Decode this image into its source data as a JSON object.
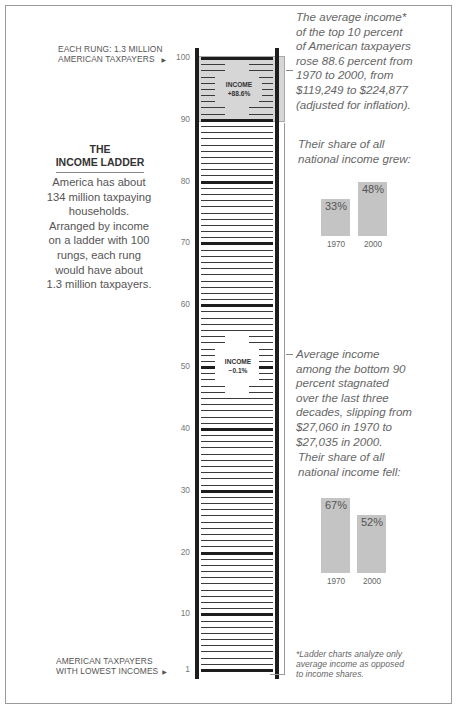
{
  "chart_data": {
    "type": "bar",
    "title": "The Income Ladder",
    "subtitle": "America has about 134 million taxpaying households. Arranged by income on a ladder with 100 rungs, each rung would have about 1.3 million taxpayers.",
    "ladder": {
      "rungs": 100,
      "tick_labels": [
        "100",
        "90",
        "80",
        "70",
        "60",
        "50",
        "40",
        "30",
        "20",
        "10",
        "1"
      ],
      "top_label": "EACH RUNG: 1.3 MILLION AMERICAN TAXPAYERS",
      "bottom_label": "AMERICAN TAXPAYERS WITH LOWEST INCOMES",
      "highlights": [
        {
          "range": [
            90,
            100
          ],
          "label": "INCOME",
          "value": "+88.6%"
        },
        {
          "range": [
            1,
            90
          ],
          "label": "INCOME",
          "value": "−0.1%"
        }
      ]
    },
    "series": [
      {
        "name": "Top 10 percent share of national income",
        "categories": [
          "1970",
          "2000"
        ],
        "values": [
          33,
          48
        ],
        "unit": "%"
      },
      {
        "name": "Bottom 90 percent share of national income",
        "categories": [
          "1970",
          "2000"
        ],
        "values": [
          67,
          52
        ],
        "unit": "%"
      }
    ],
    "ylim": [
      0,
      100
    ],
    "grid": false
  },
  "labels": {
    "top_label_line1": "EACH RUNG: 1.3 MILLION",
    "top_label_line2": "AMERICAN TAXPAYERS",
    "bottom_label_line1": "AMERICAN TAXPAYERS",
    "bottom_label_line2": "WITH LOWEST INCOMES",
    "arrow": "▶",
    "ticks": [
      "100",
      "90",
      "80",
      "70",
      "60",
      "50",
      "40",
      "30",
      "20",
      "10",
      "1"
    ]
  },
  "title": {
    "line1": "THE",
    "line2": "INCOME LADDER"
  },
  "intro": {
    "lines": [
      "America has about",
      "134 million taxpaying",
      "households.",
      "Arranged by income",
      "on a ladder with 100",
      "rungs, each rung",
      "would have about",
      "1.3 million taxpayers."
    ]
  },
  "top": {
    "box_label": "INCOME",
    "box_value": "+88.6%",
    "text_lines": [
      "The average income*",
      "of the top 10 percent",
      "of American taxpayers",
      "rose 88.6 percent from",
      "1970 to 2000, from",
      "$119,249 to $224,877",
      "(adjusted for inflation)."
    ],
    "share_lines": [
      "Their share of all",
      "national income grew:"
    ],
    "bars": [
      {
        "year": "1970",
        "value": "33%"
      },
      {
        "year": "2000",
        "value": "48%"
      }
    ]
  },
  "bottom": {
    "box_label": "INCOME",
    "box_value": "−0.1%",
    "text_lines": [
      "Average income",
      "among the bottom 90",
      "percent stagnated",
      "over the last three",
      "decades, slipping from",
      "$27,060 in 1970 to",
      "$27,035 in 2000."
    ],
    "share_lines": [
      "Their share of all",
      "national income fell:"
    ],
    "bars": [
      {
        "year": "1970",
        "value": "67%"
      },
      {
        "year": "2000",
        "value": "52%"
      }
    ]
  },
  "footnote": {
    "lines": [
      "*Ladder charts analyze only",
      "average income as opposed",
      "to income shares."
    ]
  }
}
